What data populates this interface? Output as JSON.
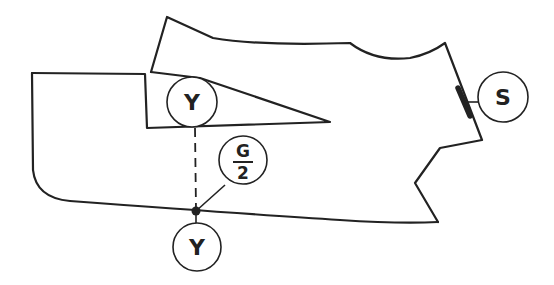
{
  "diagram": {
    "type": "technical line drawing",
    "stroke_color": "#222222",
    "background": "#ffffff",
    "labels": {
      "upper_y": "Y",
      "lower_y": "Y",
      "g_over_2_numerator": "G",
      "g_over_2_denominator": "2",
      "s": "S"
    }
  }
}
